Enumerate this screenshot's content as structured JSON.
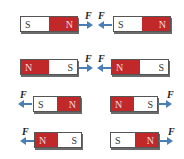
{
  "colors": {
    "north": "#c0282a",
    "south": "#ffffff",
    "arrow": "#4a7fb5"
  },
  "force_label": "F",
  "rows": [
    {
      "left": {
        "poles": [
          "S",
          "N"
        ]
      },
      "right": {
        "poles": [
          "S",
          "N"
        ]
      },
      "interaction": "attract"
    },
    {
      "left": {
        "poles": [
          "N",
          "S"
        ]
      },
      "right": {
        "poles": [
          "N",
          "S"
        ]
      },
      "interaction": "attract"
    },
    {
      "left": {
        "poles": [
          "S",
          "N"
        ]
      },
      "right": {
        "poles": [
          "N",
          "S"
        ]
      },
      "interaction": "repel"
    },
    {
      "left": {
        "poles": [
          "N",
          "S"
        ]
      },
      "right": {
        "poles": [
          "S",
          "N"
        ]
      },
      "interaction": "repel"
    }
  ]
}
